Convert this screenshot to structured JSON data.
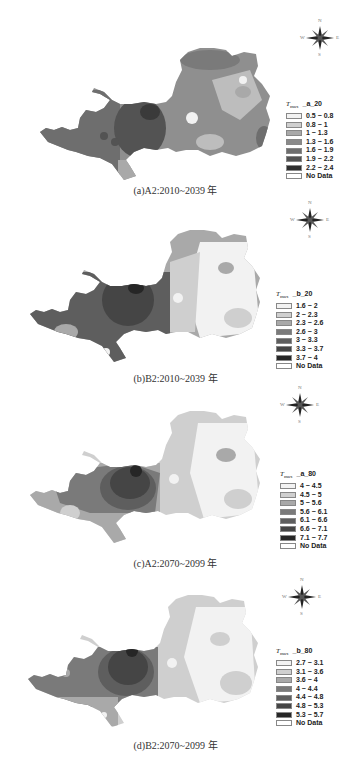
{
  "figure": {
    "panels": [
      {
        "id": "a",
        "caption": "(a)A2:2010~2039 年",
        "legend_title_var": "T",
        "legend_title_sub": "max",
        "legend_code": "_a_20",
        "classes": [
          {
            "label": "0.5 ~ 0.8",
            "color": "#f2f2f2"
          },
          {
            "label": "0.8 ~ 1",
            "color": "#cfcfcf"
          },
          {
            "label": "1 ~ 1.3",
            "color": "#a9a9a9"
          },
          {
            "label": "1.3 ~ 1.6",
            "color": "#8a8a8a"
          },
          {
            "label": "1.6 ~ 1.9",
            "color": "#6e6e6e"
          },
          {
            "label": "1.9 ~ 2.2",
            "color": "#535353"
          },
          {
            "label": "2.2 ~ 2.4",
            "color": "#2e2e2e"
          },
          {
            "label": "No Data",
            "color": "#ffffff"
          }
        ]
      },
      {
        "id": "b",
        "caption": "(b)B2:2010~2039 年",
        "legend_title_var": "T",
        "legend_title_sub": "max",
        "legend_code": "_b_20",
        "classes": [
          {
            "label": "1.6 ~ 2",
            "color": "#f2f2f2"
          },
          {
            "label": "2 ~ 2.3",
            "color": "#cfcfcf"
          },
          {
            "label": "2.3 ~ 2.6",
            "color": "#a9a9a9"
          },
          {
            "label": "2.6 ~ 3",
            "color": "#7a7a7a"
          },
          {
            "label": "3 ~ 3.3",
            "color": "#5e5e5e"
          },
          {
            "label": "3.3 ~ 3.7",
            "color": "#454545"
          },
          {
            "label": "3.7 ~ 4",
            "color": "#262626"
          },
          {
            "label": "No Data",
            "color": "#ffffff"
          }
        ]
      },
      {
        "id": "c",
        "caption": "(c)A2:2070~2099 年",
        "legend_title_var": "T",
        "legend_title_sub": "max",
        "legend_code": "_a_80",
        "classes": [
          {
            "label": "4 ~ 4.5",
            "color": "#f2f2f2"
          },
          {
            "label": "4.5 ~ 5",
            "color": "#cfcfcf"
          },
          {
            "label": "5 ~ 5.6",
            "color": "#a9a9a9"
          },
          {
            "label": "5.6 ~ 6.1",
            "color": "#7a7a7a"
          },
          {
            "label": "6.1 ~ 6.6",
            "color": "#5e5e5e"
          },
          {
            "label": "6.6 ~ 7.1",
            "color": "#454545"
          },
          {
            "label": "7.1 ~ 7.7",
            "color": "#262626"
          },
          {
            "label": "No Data",
            "color": "#ffffff"
          }
        ]
      },
      {
        "id": "d",
        "caption": "(d)B2:2070~2099 年",
        "legend_title_var": "T",
        "legend_title_sub": "max",
        "legend_code": "_b_80",
        "classes": [
          {
            "label": "2.7 ~ 3.1",
            "color": "#f2f2f2"
          },
          {
            "label": "3.1 ~ 3.6",
            "color": "#cfcfcf"
          },
          {
            "label": "3.6 ~ 4",
            "color": "#a9a9a9"
          },
          {
            "label": "4 ~ 4.4",
            "color": "#7a7a7a"
          },
          {
            "label": "4.4 ~ 4.8",
            "color": "#5e5e5e"
          },
          {
            "label": "4.8 ~ 5.3",
            "color": "#454545"
          },
          {
            "label": "5.3 ~ 5.7",
            "color": "#262626"
          },
          {
            "label": "No Data",
            "color": "#ffffff"
          }
        ]
      }
    ],
    "compass": {
      "n": "N",
      "s": "S",
      "e": "E",
      "w": "W"
    }
  }
}
